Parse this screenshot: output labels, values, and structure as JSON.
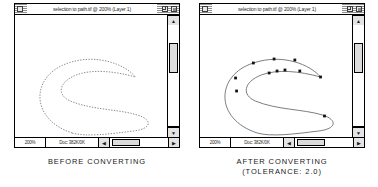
{
  "figure": {
    "panels": [
      {
        "id": "before",
        "window": {
          "title": "selection to path.tif @ 200% (Layer 1)",
          "close_icon": "close-box-icon",
          "zoom_icon": "zoom-box-icon",
          "grow_icon": "grow-box-icon",
          "status": {
            "zoom": "200%",
            "doc": "Doc: 382K/0K"
          },
          "scroll": {
            "up_glyph": "▲",
            "down_glyph": "▼",
            "left_glyph": "◀",
            "right_glyph": "▶"
          }
        },
        "canvas": {
          "render_mode": "dashed-selection",
          "stroke_color": "#8a8a8a",
          "dash_pattern": "1.4 1.4",
          "description": "marching-ants selection outline, S shape"
        },
        "caption_line1": "BEFORE CONVERTING",
        "caption_line2": ""
      },
      {
        "id": "after",
        "window": {
          "title": "selection to path.tif @ 200% (Layer 1)",
          "close_icon": "close-box-icon",
          "zoom_icon": "zoom-box-icon",
          "grow_icon": "grow-box-icon",
          "status": {
            "zoom": "200%",
            "doc": "Doc: 382K/0K"
          },
          "scroll": {
            "up_glyph": "▲",
            "down_glyph": "▼",
            "left_glyph": "◀",
            "right_glyph": "▶"
          }
        },
        "canvas": {
          "render_mode": "bezier-path",
          "stroke_color": "#5c5c5c",
          "anchor_color": "#111111",
          "anchor_count": 11,
          "description": "converted bezier path with visible anchor points, S shape"
        },
        "caption_line1": "AFTER CONVERTING",
        "caption_line2": "(TOLERANCE: 2.0)"
      }
    ]
  },
  "path_geometry": {
    "outline_d": "M 58 118 C 14 104, 16 60, 54 48 C 84 38, 112 50, 122 62 C 100 56, 78 54, 62 60 C 44 67, 42 80, 56 86 C 78 95, 104 94, 124 100 C 140 105, 138 114, 120 116 C 96 119, 72 122, 58 118 Z",
    "anchors": [
      {
        "x": 54,
        "y": 48
      },
      {
        "x": 75,
        "y": 44
      },
      {
        "x": 96,
        "y": 45
      },
      {
        "x": 122,
        "y": 62
      },
      {
        "x": 101,
        "y": 56
      },
      {
        "x": 86,
        "y": 55
      },
      {
        "x": 78,
        "y": 56
      },
      {
        "x": 70,
        "y": 58
      },
      {
        "x": 37,
        "y": 76
      },
      {
        "x": 126,
        "y": 101
      },
      {
        "x": 36,
        "y": 63
      }
    ]
  }
}
